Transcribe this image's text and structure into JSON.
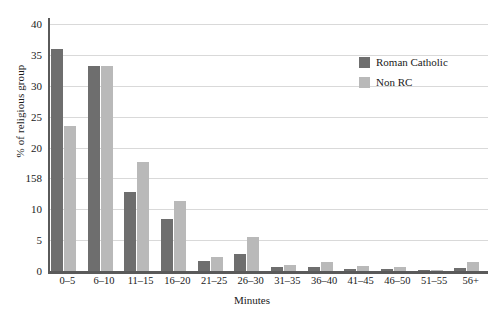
{
  "chart_data": {
    "type": "bar",
    "title": "",
    "xlabel": "Minutes",
    "ylabel": "% of religious group",
    "categories": [
      "0–5",
      "6–10",
      "11–15",
      "16–20",
      "21–25",
      "26–30",
      "31–35",
      "36–40",
      "41–45",
      "46–50",
      "51–55",
      "56+"
    ],
    "series": [
      {
        "name": "Roman Catholic",
        "color": "#6e6e6e",
        "values": [
          36.0,
          33.3,
          12.8,
          8.4,
          1.6,
          2.7,
          0.6,
          0.7,
          0.4,
          0.3,
          0.1,
          0.5
        ]
      },
      {
        "name": "Non RC",
        "color": "#b9b9b9",
        "values": [
          23.5,
          33.3,
          17.6,
          11.3,
          2.2,
          5.5,
          0.9,
          1.4,
          0.8,
          0.6,
          0.1,
          1.4
        ]
      }
    ],
    "ylim": [
      0,
      41
    ],
    "yticks": [
      0,
      5,
      10,
      15,
      20,
      25,
      30,
      35,
      40
    ],
    "ytick_labels": [
      "0",
      "5",
      "10",
      "158",
      "20",
      "25",
      "30",
      "35",
      "40"
    ],
    "grid": true,
    "legend_position": "top-right"
  },
  "legend": {
    "items": [
      {
        "label": "Roman Catholic",
        "color": "#6e6e6e"
      },
      {
        "label": "Non RC",
        "color": "#b9b9b9"
      }
    ]
  }
}
